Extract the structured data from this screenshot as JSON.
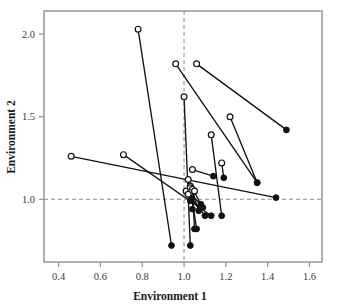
{
  "chart_data": {
    "type": "scatter",
    "title": "",
    "xlabel": "Environment 1",
    "ylabel": "Environment 2",
    "xlim": [
      0.33,
      1.66
    ],
    "ylim": [
      0.62,
      2.14
    ],
    "xticks": [
      0.4,
      0.6,
      0.8,
      1.0,
      1.2,
      1.4,
      1.6
    ],
    "xtick_labels": [
      "0.4",
      "0.6",
      "0.8",
      "1.0",
      "1.2",
      "1.4",
      "1.6"
    ],
    "yticks": [
      1.0,
      1.5,
      2.0
    ],
    "ytick_labels": [
      "1.0",
      "1.5",
      "2.0"
    ],
    "grid": false,
    "reference_lines": [
      {
        "axis": "x",
        "value": 1.0,
        "style": "dashed",
        "color": "#8a8a8a"
      },
      {
        "axis": "y",
        "value": 1.0,
        "style": "dashed",
        "color": "#8a8a8a"
      }
    ],
    "marker_open_label": "open circle",
    "marker_filled_label": "filled circle",
    "series": [
      {
        "name": "pair-1",
        "open": [
          0.78,
          2.03
        ],
        "filled": [
          0.94,
          0.72
        ]
      },
      {
        "name": "pair-2",
        "open": [
          0.96,
          1.82
        ],
        "filled": [
          1.35,
          1.1
        ]
      },
      {
        "name": "pair-3",
        "open": [
          1.06,
          1.82
        ],
        "filled": [
          1.49,
          1.42
        ]
      },
      {
        "name": "pair-4",
        "open": [
          1.0,
          1.62
        ],
        "filled": [
          1.03,
          0.72
        ]
      },
      {
        "name": "pair-5",
        "open": [
          1.22,
          1.5
        ],
        "filled": [
          1.35,
          1.1
        ]
      },
      {
        "name": "pair-6",
        "open": [
          1.13,
          1.39
        ],
        "filled": [
          1.18,
          0.9
        ]
      },
      {
        "name": "pair-7",
        "open": [
          0.71,
          1.27
        ],
        "filled": [
          1.13,
          0.9
        ]
      },
      {
        "name": "pair-8",
        "open": [
          0.46,
          1.26
        ],
        "filled": [
          1.44,
          1.01
        ]
      },
      {
        "name": "pair-9",
        "open": [
          1.18,
          1.22
        ],
        "filled": [
          1.19,
          1.13
        ]
      },
      {
        "name": "pair-10",
        "open": [
          1.04,
          1.18
        ],
        "filled": [
          1.14,
          1.14
        ]
      },
      {
        "name": "pair-11",
        "open": [
          1.02,
          1.12
        ],
        "filled": [
          1.08,
          0.97
        ]
      },
      {
        "name": "pair-12",
        "open": [
          1.01,
          1.05
        ],
        "filled": [
          1.1,
          0.9
        ]
      },
      {
        "name": "pair-13",
        "open": [
          1.03,
          1.08
        ],
        "filled": [
          1.07,
          0.93
        ]
      },
      {
        "name": "pair-14",
        "open": [
          1.03,
          1.07
        ],
        "filled": [
          1.06,
          0.82
        ]
      },
      {
        "name": "pair-15",
        "open": [
          1.04,
          1.06
        ],
        "filled": [
          1.05,
          0.82
        ]
      },
      {
        "name": "pair-16",
        "open": [
          1.03,
          1.04
        ],
        "filled": [
          1.09,
          0.95
        ]
      },
      {
        "name": "pair-17",
        "open": [
          1.05,
          1.05
        ],
        "filled": [
          1.04,
          0.94
        ]
      },
      {
        "name": "pair-18",
        "open": [
          1.02,
          1.03
        ],
        "filled": [
          1.03,
          0.99
        ]
      }
    ]
  },
  "style": {
    "frame_color": "#8f8f8f",
    "point_color": "#111111",
    "line_color": "#111111",
    "dash_color": "#8a8a8a",
    "background": "#ffffff"
  }
}
